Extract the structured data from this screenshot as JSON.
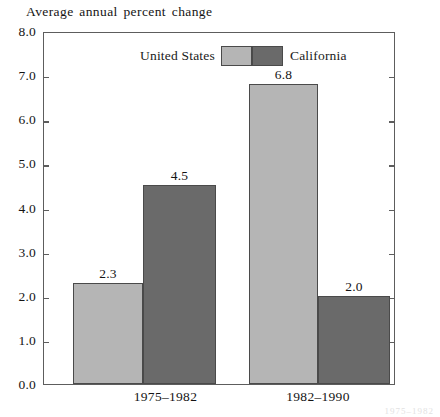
{
  "chart_data": {
    "type": "bar",
    "title": "Average annual percent change",
    "xlabel": "",
    "ylabel": "",
    "categories": [
      "1975–1982",
      "1982–1990"
    ],
    "series": [
      {
        "name": "United States",
        "values": [
          2.3,
          6.8
        ],
        "color": "#b5b5b5"
      },
      {
        "name": "California",
        "values": [
          4.5,
          2.0
        ],
        "color": "#6a6a6a"
      }
    ],
    "value_labels": [
      [
        "2.3",
        "6.8"
      ],
      [
        "4.5",
        "2.0"
      ]
    ],
    "ylim": [
      0.0,
      8.0
    ],
    "ytick_labels": [
      "0.0",
      "1.0",
      "2.0",
      "3.0",
      "4.0",
      "5.0",
      "6.0",
      "7.0",
      "8.0"
    ],
    "ytick_values": [
      0,
      1,
      2,
      3,
      4,
      5,
      6,
      7,
      8
    ],
    "grid": false,
    "legend_position": "top-center",
    "frame": true,
    "ticks_both_sides": true
  },
  "legend": {
    "united_states_label": "United States",
    "california_label": "California"
  },
  "artifact": {
    "bleed_text": "1975–1982"
  },
  "colors": {
    "united_states": "#b5b5b5",
    "california": "#6a6a6a",
    "axis": "#5d5d5d",
    "bar_outline": "#4a4a4a",
    "text": "#141414",
    "background": "#ffffff"
  }
}
